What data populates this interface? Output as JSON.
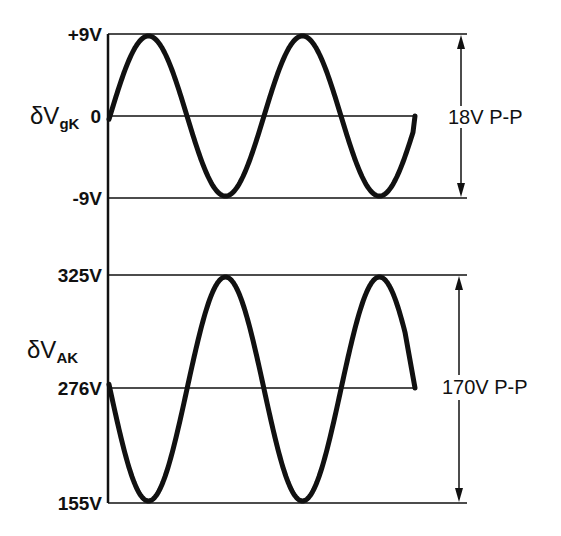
{
  "colors": {
    "ink": "#111111",
    "background": "#ffffff"
  },
  "upper_plot": {
    "quantity_symbol": "δV",
    "quantity_subscript": "gK",
    "tick_labels": {
      "top": "+9V",
      "middle": "0",
      "bottom": "-9V"
    },
    "span_label": "18V P-P"
  },
  "lower_plot": {
    "quantity_symbol": "δV",
    "quantity_subscript": "AK",
    "tick_labels": {
      "top": "325V",
      "middle": "276V",
      "bottom": "155V"
    },
    "span_label": "170V P-P"
  },
  "chart_data": [
    {
      "type": "line",
      "title": "Grid-cathode voltage swing",
      "ylabel": "δV_gK",
      "xlabel": "",
      "y_ticks": [
        "+9V",
        "0",
        "-9V"
      ],
      "ylim": [
        -9,
        9
      ],
      "baseline": 0,
      "peak_to_peak": "18V P-P",
      "waveform": "sine",
      "cycles_shown": 2.0,
      "phase": "starts at 0 rising",
      "peaks": [
        9,
        9
      ],
      "troughs": [
        -9,
        -9
      ]
    },
    {
      "type": "line",
      "title": "Anode-cathode voltage swing",
      "ylabel": "δV_AK",
      "xlabel": "",
      "y_ticks": [
        "325V",
        "276V",
        "155V"
      ],
      "ylim": [
        155,
        325
      ],
      "baseline": 276,
      "peak_to_peak": "170V P-P",
      "waveform": "sine (inverted relative to grid)",
      "cycles_shown": 2.0,
      "phase": "starts near 276V falling",
      "peaks": [
        325,
        325
      ],
      "troughs": [
        155,
        155
      ]
    }
  ]
}
